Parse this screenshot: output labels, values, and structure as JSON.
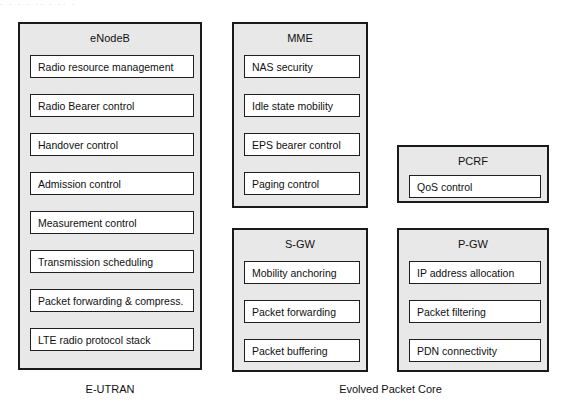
{
  "diagram": {
    "scan_artifact": "· · ·  ·  ·· ·  ··  ·",
    "nodes": [
      {
        "id": "enodeb",
        "title": "eNodeB",
        "items": [
          "Radio resource management",
          "Radio Bearer control",
          "Handover control",
          "Admission control",
          "Measurement control",
          "Transmission scheduling",
          "Packet forwarding & compress.",
          "LTE radio protocol stack"
        ]
      },
      {
        "id": "mme",
        "title": "MME",
        "items": [
          "NAS security",
          "Idle state mobility",
          "EPS bearer control",
          "Paging control"
        ]
      },
      {
        "id": "pcrf",
        "title": "PCRF",
        "items": [
          "QoS control"
        ]
      },
      {
        "id": "sgw",
        "title": "S-GW",
        "items": [
          "Mobility anchoring",
          "Packet forwarding",
          "Packet buffering"
        ]
      },
      {
        "id": "pgw",
        "title": "P-GW",
        "items": [
          "IP address allocation",
          "Packet filtering",
          "PDN connectivity"
        ]
      }
    ],
    "captions": [
      {
        "id": "e-utran",
        "text": "E-UTRAN"
      },
      {
        "id": "evolved-packet-core",
        "text": "Evolved Packet Core"
      }
    ],
    "colors": {
      "node_fill": "#e8e8e8",
      "node_border": "#1a1a1a",
      "item_fill": "#ffffff",
      "item_border": "#1f1f1f",
      "text": "#101010",
      "page_background": "#ffffff"
    }
  }
}
